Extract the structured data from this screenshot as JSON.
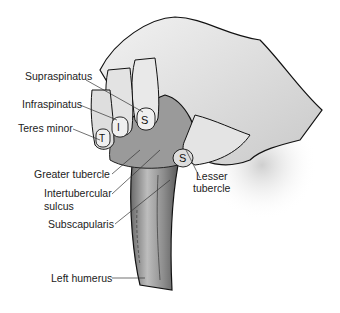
{
  "figure": {
    "labels": {
      "supraspinatus": "Supraspinatus",
      "infraspinatus": "Infraspinatus",
      "teres_minor": "Teres minor",
      "greater_tubercle": "Greater tubercle",
      "intertubercular_1": "Intertubercular",
      "intertubercular_2": "sulcus",
      "subscapularis": "Subscapularis",
      "lesser_tubercle_1": "Lesser",
      "lesser_tubercle_2": "tubercle",
      "left_humerus": "Left humerus"
    },
    "nail_letters": {
      "thumb": "S",
      "index": "S",
      "middle": "I",
      "ring": "T"
    }
  }
}
